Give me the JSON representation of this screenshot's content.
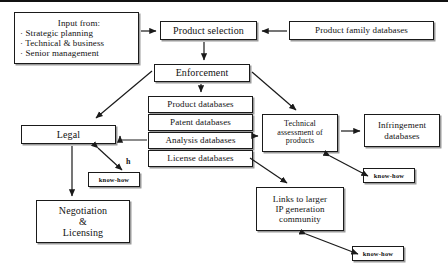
{
  "diagram": {
    "nodes": {
      "input": {
        "heading": "Input from:",
        "bullets": [
          "· Strategic planning",
          "· Technical & business",
          "· Senior management"
        ]
      },
      "product_selection": {
        "label": "Product  selection"
      },
      "product_family_databases": {
        "label": "Product family databases"
      },
      "enforcement": {
        "label": "Enforcement"
      },
      "product_databases": {
        "label": "Product databases"
      },
      "patent_databases": {
        "label": "Patent databases"
      },
      "analysis_databases": {
        "label": "Analysis databases"
      },
      "license_databases": {
        "label": "License databases"
      },
      "legal": {
        "label": "Legal"
      },
      "technical_assessment": {
        "line1": "Technical",
        "line2": "assessment of",
        "line3": "products"
      },
      "infringement_databases": {
        "line1": "Infringement",
        "line2": "databases"
      },
      "links_community": {
        "line1": "Links to larger",
        "line2": "IP generation",
        "line3": "community"
      },
      "negotiation": {
        "line1": "Negotiation",
        "line2": "&",
        "line3": "Licensing"
      },
      "know_how_left": {
        "label": "know-how"
      },
      "know_how_right": {
        "label": "know-how"
      },
      "know_how_bottom": {
        "label": "know-how"
      }
    },
    "labels": {
      "h_marker": "h"
    },
    "caption": "",
    "colors": {
      "stroke": "#1a1a1a",
      "shadow": "#9a9a9a",
      "background": "#ffffff",
      "text": "#111111"
    }
  }
}
